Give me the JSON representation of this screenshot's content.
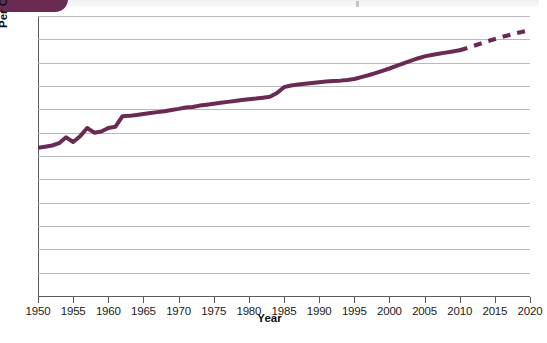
{
  "figure": {
    "badge": "figure-number-badge",
    "background_color": "#ffffff",
    "line_color": "#6b2a54",
    "grid_color": "#b9b9c2",
    "axis_color": "#5a5a62"
  },
  "chart_data": {
    "type": "line",
    "title": "",
    "xlabel": "Year",
    "ylabel": "Per Capita Food Production",
    "xlim": [
      1950,
      2020
    ],
    "ylim": [
      0,
      120
    ],
    "grid": true,
    "legend": "none",
    "y_ticks": [
      0,
      10,
      20,
      30,
      40,
      50,
      60,
      70,
      80,
      90,
      100,
      110,
      120
    ],
    "x_ticks": [
      1950,
      1955,
      1960,
      1965,
      1970,
      1975,
      1980,
      1985,
      1990,
      1995,
      2000,
      2005,
      2010,
      2015,
      2020
    ],
    "series": [
      {
        "name": "Per Capita Food Production (historical)",
        "style": "solid",
        "color": "#6b2a54",
        "x": [
          1950,
          1951,
          1952,
          1953,
          1954,
          1955,
          1956,
          1957,
          1958,
          1959,
          1960,
          1961,
          1962,
          1963,
          1964,
          1965,
          1966,
          1967,
          1968,
          1969,
          1970,
          1971,
          1972,
          1973,
          1974,
          1975,
          1976,
          1977,
          1978,
          1979,
          1980,
          1981,
          1982,
          1983,
          1984,
          1985,
          1986,
          1987,
          1988,
          1989,
          1990,
          1991,
          1992,
          1993,
          1994,
          1995,
          1996,
          1997,
          1998,
          1999,
          2000,
          2001,
          2002,
          2003,
          2004,
          2005,
          2006,
          2007,
          2008,
          2009,
          2010
        ],
        "y": [
          63.5,
          64.0,
          64.5,
          65.5,
          68.0,
          66.0,
          68.5,
          72.0,
          70.0,
          70.5,
          72.0,
          72.5,
          77.0,
          77.2,
          77.6,
          78.0,
          78.4,
          78.8,
          79.2,
          79.7,
          80.2,
          80.8,
          81.0,
          81.6,
          82.0,
          82.4,
          82.8,
          83.2,
          83.6,
          84.0,
          84.3,
          84.6,
          85.0,
          85.4,
          87.0,
          89.5,
          90.2,
          90.6,
          91.0,
          91.3,
          91.6,
          91.9,
          92.1,
          92.3,
          92.6,
          93.0,
          93.8,
          94.6,
          95.5,
          96.5,
          97.5,
          98.6,
          99.7,
          100.8,
          101.8,
          102.7,
          103.3,
          103.8,
          104.3,
          104.8,
          105.3
        ]
      },
      {
        "name": "Per Capita Food Production (projected)",
        "style": "dashed",
        "color": "#6b2a54",
        "x": [
          2010,
          2012,
          2014,
          2016,
          2018,
          2020
        ],
        "y": [
          105.3,
          107.2,
          109.2,
          111.0,
          112.6,
          114.0
        ]
      }
    ]
  }
}
